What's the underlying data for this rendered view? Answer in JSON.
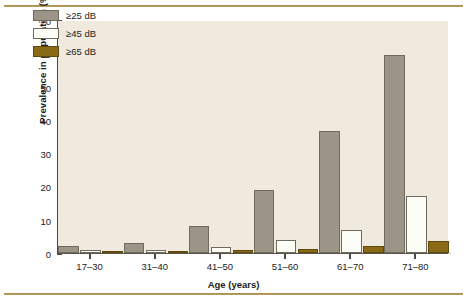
{
  "figure": {
    "background_color": "#ffffff",
    "rule_color": "#9c8441",
    "plot_background_color": "#efeadd",
    "axis_color": "#4a4a46"
  },
  "chart_data": {
    "type": "bar",
    "title": "",
    "xlabel": "Age (years)",
    "ylabel": "Prevalence in population (%)",
    "categories": [
      "17–30",
      "31–40",
      "41–50",
      "51–60",
      "61–70",
      "71–80"
    ],
    "ylim": [
      0,
      70
    ],
    "yticks": [
      0,
      10,
      20,
      30,
      40,
      50,
      60,
      70
    ],
    "ytick_labels": [
      "0",
      "10",
      "20",
      "30",
      "40",
      "50",
      "60",
      "70"
    ],
    "grid": false,
    "legend_position": "upper-left-inside",
    "series": [
      {
        "name": "≥25 dB",
        "color": "#9c9486",
        "values": [
          2.1,
          2.9,
          8.2,
          18.9,
          36.6,
          59.4
        ]
      },
      {
        "name": "≥45 dB",
        "color": "#fdfdf8",
        "values": [
          0.9,
          0.8,
          1.7,
          4.0,
          7.0,
          17.2
        ]
      },
      {
        "name": "≥65 dB",
        "color": "#8a6a17",
        "values": [
          0.4,
          0.6,
          0.8,
          1.2,
          2.1,
          3.6
        ]
      }
    ]
  }
}
